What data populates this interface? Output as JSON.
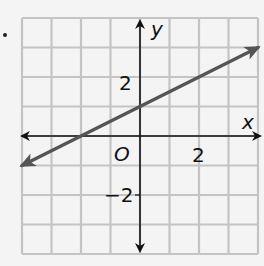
{
  "chart_data": {
    "type": "line",
    "title": "",
    "xlabel": "x",
    "ylabel": "y",
    "origin_label": "O",
    "xlim": [
      -4,
      4
    ],
    "ylim": [
      -4,
      4
    ],
    "grid": true,
    "x_tick_labels": [
      {
        "value": 2,
        "label": "2"
      }
    ],
    "y_tick_labels": [
      {
        "value": 2,
        "label": "2"
      },
      {
        "value": -2,
        "label": "−2"
      }
    ],
    "series": [
      {
        "name": "line",
        "equation": "y = 0.5x + 1",
        "x": [
          -4,
          4
        ],
        "y": [
          -1,
          3
        ],
        "arrows_both_ends": true,
        "color": "#555555"
      }
    ],
    "legend": null
  },
  "colors": {
    "grid": "#c4c4c4",
    "axes": "#111111",
    "line": "#555555",
    "background": "#f4f4f4"
  }
}
